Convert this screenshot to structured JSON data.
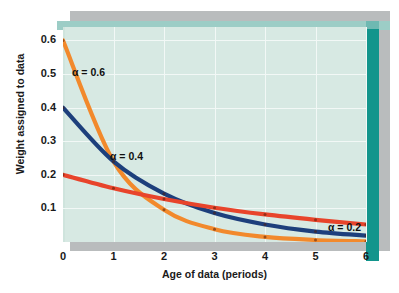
{
  "chart_data": {
    "type": "line",
    "title": "",
    "xlabel": "Age of data (periods)",
    "ylabel": "Weight assigned to data",
    "x": [
      0,
      1,
      2,
      3,
      4,
      5,
      6
    ],
    "xtick_labels": [
      "0",
      "1",
      "2",
      "3",
      "4",
      "5",
      "6"
    ],
    "ytick_labels": [
      "0.1",
      "0.2",
      "0.3",
      "0.4",
      "0.5",
      "0.6"
    ],
    "ytick_values": [
      0.1,
      0.2,
      0.3,
      0.4,
      0.5,
      0.6
    ],
    "xlim": [
      0,
      6
    ],
    "ylim": [
      0,
      0.64
    ],
    "grid": true,
    "legend_position": "inline-annotations",
    "series": [
      {
        "name": "alpha = 0.2",
        "label": "α = 0.2",
        "color": "#e8442b",
        "values": [
          0.2,
          0.16,
          0.128,
          0.102,
          0.082,
          0.066,
          0.052
        ]
      },
      {
        "name": "alpha = 0.4",
        "label": "α = 0.4",
        "color": "#1d3f7c",
        "values": [
          0.4,
          0.24,
          0.144,
          0.086,
          0.052,
          0.031,
          0.019
        ]
      },
      {
        "name": "alpha = 0.6",
        "label": "α = 0.6",
        "color": "#f2892c",
        "values": [
          0.6,
          0.24,
          0.096,
          0.038,
          0.015,
          0.006,
          0.002
        ]
      }
    ],
    "annotations": [
      {
        "text": "α = 0.6",
        "x_px": 72,
        "y_px": 66
      },
      {
        "text": "α = 0.4",
        "x_px": 110,
        "y_px": 150
      },
      {
        "text": "α = 0.2",
        "x_px": 328,
        "y_px": 221
      }
    ],
    "colors": {
      "panel_face": "#d7e9e3",
      "panel_bevel_top": "#9ccdc6",
      "panel_bevel_right": "#12958c",
      "shadow": "#b9bcbd",
      "gridline": "#f2f8f6"
    }
  }
}
